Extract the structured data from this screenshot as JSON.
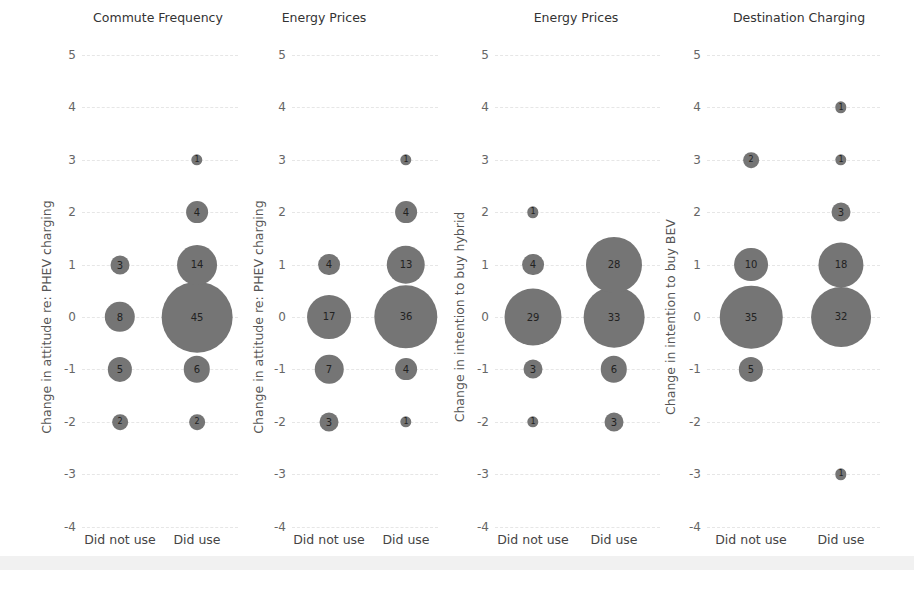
{
  "chart_data": [
    {
      "type": "scatter",
      "subtype": "bubble",
      "title": "Commute Frequency",
      "xlabel": "",
      "ylabel": "Change in attitude re: PHEV charging",
      "categories": [
        "Did not use",
        "Did use"
      ],
      "yticks": [
        5,
        4,
        3,
        2,
        1,
        0,
        -1,
        -2,
        -3,
        -4
      ],
      "ylim": [
        -4,
        5
      ],
      "grid": true,
      "points": [
        {
          "x": "Did not use",
          "y": 1,
          "count": 3
        },
        {
          "x": "Did not use",
          "y": 0,
          "count": 8
        },
        {
          "x": "Did not use",
          "y": -1,
          "count": 5
        },
        {
          "x": "Did not use",
          "y": -2,
          "count": 2
        },
        {
          "x": "Did use",
          "y": 3,
          "count": 1
        },
        {
          "x": "Did use",
          "y": 2,
          "count": 4
        },
        {
          "x": "Did use",
          "y": 1,
          "count": 14
        },
        {
          "x": "Did use",
          "y": 0,
          "count": 45
        },
        {
          "x": "Did use",
          "y": -1,
          "count": 6
        },
        {
          "x": "Did use",
          "y": -2,
          "count": 2
        }
      ]
    },
    {
      "type": "scatter",
      "subtype": "bubble",
      "title": "Energy Prices",
      "xlabel": "",
      "ylabel": "Change in attitude re: PHEV charging",
      "categories": [
        "Did not use",
        "Did use"
      ],
      "yticks": [
        5,
        4,
        3,
        2,
        1,
        0,
        -1,
        -2,
        -3,
        -4
      ],
      "ylim": [
        -4,
        5
      ],
      "grid": true,
      "points": [
        {
          "x": "Did not use",
          "y": 1,
          "count": 4
        },
        {
          "x": "Did not use",
          "y": 0,
          "count": 17
        },
        {
          "x": "Did not use",
          "y": -1,
          "count": 7
        },
        {
          "x": "Did not use",
          "y": -2,
          "count": 3
        },
        {
          "x": "Did use",
          "y": 3,
          "count": 1
        },
        {
          "x": "Did use",
          "y": 2,
          "count": 4
        },
        {
          "x": "Did use",
          "y": 1,
          "count": 13
        },
        {
          "x": "Did use",
          "y": 0,
          "count": 36
        },
        {
          "x": "Did use",
          "y": -1,
          "count": 4
        },
        {
          "x": "Did use",
          "y": -2,
          "count": 1
        }
      ]
    },
    {
      "type": "scatter",
      "subtype": "bubble",
      "title": "Energy Prices",
      "xlabel": "",
      "ylabel": "Change in intention to buy hybrid",
      "categories": [
        "Did not use",
        "Did use"
      ],
      "yticks": [
        5,
        4,
        3,
        2,
        1,
        0,
        -1,
        -2,
        -3,
        -4
      ],
      "ylim": [
        -4,
        5
      ],
      "grid": true,
      "points": [
        {
          "x": "Did not use",
          "y": 2,
          "count": 1
        },
        {
          "x": "Did not use",
          "y": 1,
          "count": 4
        },
        {
          "x": "Did not use",
          "y": 0,
          "count": 29
        },
        {
          "x": "Did not use",
          "y": -1,
          "count": 3
        },
        {
          "x": "Did not use",
          "y": -2,
          "count": 1
        },
        {
          "x": "Did use",
          "y": 1,
          "count": 28
        },
        {
          "x": "Did use",
          "y": 0,
          "count": 33
        },
        {
          "x": "Did use",
          "y": -1,
          "count": 6
        },
        {
          "x": "Did use",
          "y": -2,
          "count": 3
        }
      ]
    },
    {
      "type": "scatter",
      "subtype": "bubble",
      "title": "Destination Charging",
      "xlabel": "",
      "ylabel": "Change in intention to buy BEV",
      "categories": [
        "Did not use",
        "Did use"
      ],
      "yticks": [
        5,
        4,
        3,
        2,
        1,
        0,
        -1,
        -2,
        -3,
        -4
      ],
      "ylim": [
        -4,
        5
      ],
      "grid": true,
      "points": [
        {
          "x": "Did not use",
          "y": 3,
          "count": 2
        },
        {
          "x": "Did not use",
          "y": 1,
          "count": 10
        },
        {
          "x": "Did not use",
          "y": 0,
          "count": 35
        },
        {
          "x": "Did not use",
          "y": -1,
          "count": 5
        },
        {
          "x": "Did use",
          "y": 4,
          "count": 1
        },
        {
          "x": "Did use",
          "y": 3,
          "count": 1
        },
        {
          "x": "Did use",
          "y": 2,
          "count": 3
        },
        {
          "x": "Did use",
          "y": 1,
          "count": 18
        },
        {
          "x": "Did use",
          "y": 0,
          "count": 32
        },
        {
          "x": "Did use",
          "y": -3,
          "count": 1
        }
      ]
    }
  ],
  "style": {
    "bubble_color": "#757575",
    "grid_color": "#e6e6e6",
    "text_color": "#555555"
  }
}
